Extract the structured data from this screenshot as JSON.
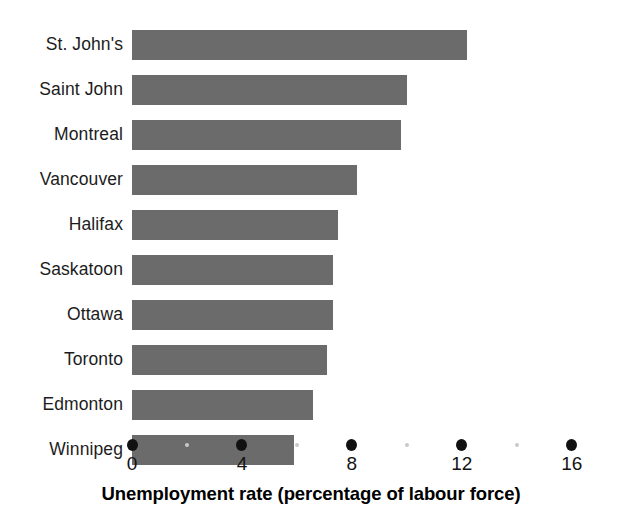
{
  "chart_data": {
    "type": "bar",
    "orientation": "horizontal",
    "title": "",
    "xlabel": "Unemployment rate (percentage of labour force)",
    "ylabel": "",
    "categories": [
      "St. John's",
      "Saint John",
      "Montreal",
      "Vancouver",
      "Halifax",
      "Saskatoon",
      "Ottawa",
      "Toronto",
      "Edmonton",
      "Winnipeg"
    ],
    "values": [
      12.2,
      10.0,
      9.8,
      8.2,
      7.5,
      7.3,
      7.3,
      7.1,
      6.6,
      5.9
    ],
    "xlim": [
      0,
      17.1
    ],
    "xticks": [
      0,
      4,
      8,
      12,
      16
    ],
    "xtick_labels": [
      "0",
      "4",
      "8",
      "12",
      "16"
    ],
    "minor_xticks": [
      2,
      6,
      10,
      14
    ],
    "grid": false,
    "legend": false,
    "bar_color": "#6b6b6b",
    "tick_color": "#111111",
    "minor_tick_color": "#c9c9c9",
    "text_color": "#1a1a1a",
    "background": "#ffffff"
  },
  "axis_title": {
    "text": "Unemployment rate (percentage of labour force)"
  }
}
